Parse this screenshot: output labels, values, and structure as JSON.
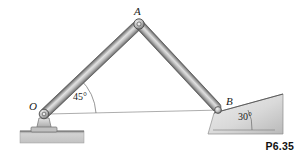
{
  "figure": {
    "number": "P6.35",
    "type": "mechanism-diagram",
    "background_color": "#ffffff"
  },
  "labels": {
    "point_o": "O",
    "point_a": "A",
    "point_b": "B"
  },
  "angles": {
    "at_o": "45°",
    "at_b": "30°"
  },
  "geometry": {
    "point_o": {
      "x": 44,
      "y": 114
    },
    "point_a": {
      "x": 139,
      "y": 24
    },
    "point_b": {
      "x": 219,
      "y": 110
    },
    "link_oa_angle_deg": 45,
    "incline_angle_deg": 30,
    "horizontal_reference_line": {
      "x1": 48,
      "y1": 114,
      "x2": 222,
      "y2": 110
    }
  },
  "colors": {
    "link_light": "#d8d8d8",
    "link_mid": "#b3b3b3",
    "link_dark": "#6e6e6e",
    "outline": "#4a4a4a",
    "ground_fill": "#cfcfcf",
    "incline_fill": "#dcdcdc",
    "text": "#1a1a1a",
    "thin_line": "#8a8a8a"
  }
}
